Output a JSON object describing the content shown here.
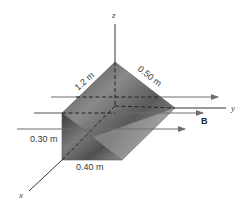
{
  "diagram": {
    "axes": {
      "x": "x",
      "y": "y",
      "z": "z"
    },
    "field_label": "B",
    "dimensions": {
      "slant": "1.2 m",
      "depth": "0.50 m",
      "height": "0.30 m",
      "base": "0.40 m"
    },
    "colors": {
      "axis": "#333333",
      "arrow": "#6e6e6e",
      "wedge_dark": "#3d3d3d",
      "wedge_light": "#b0b0b0"
    }
  }
}
